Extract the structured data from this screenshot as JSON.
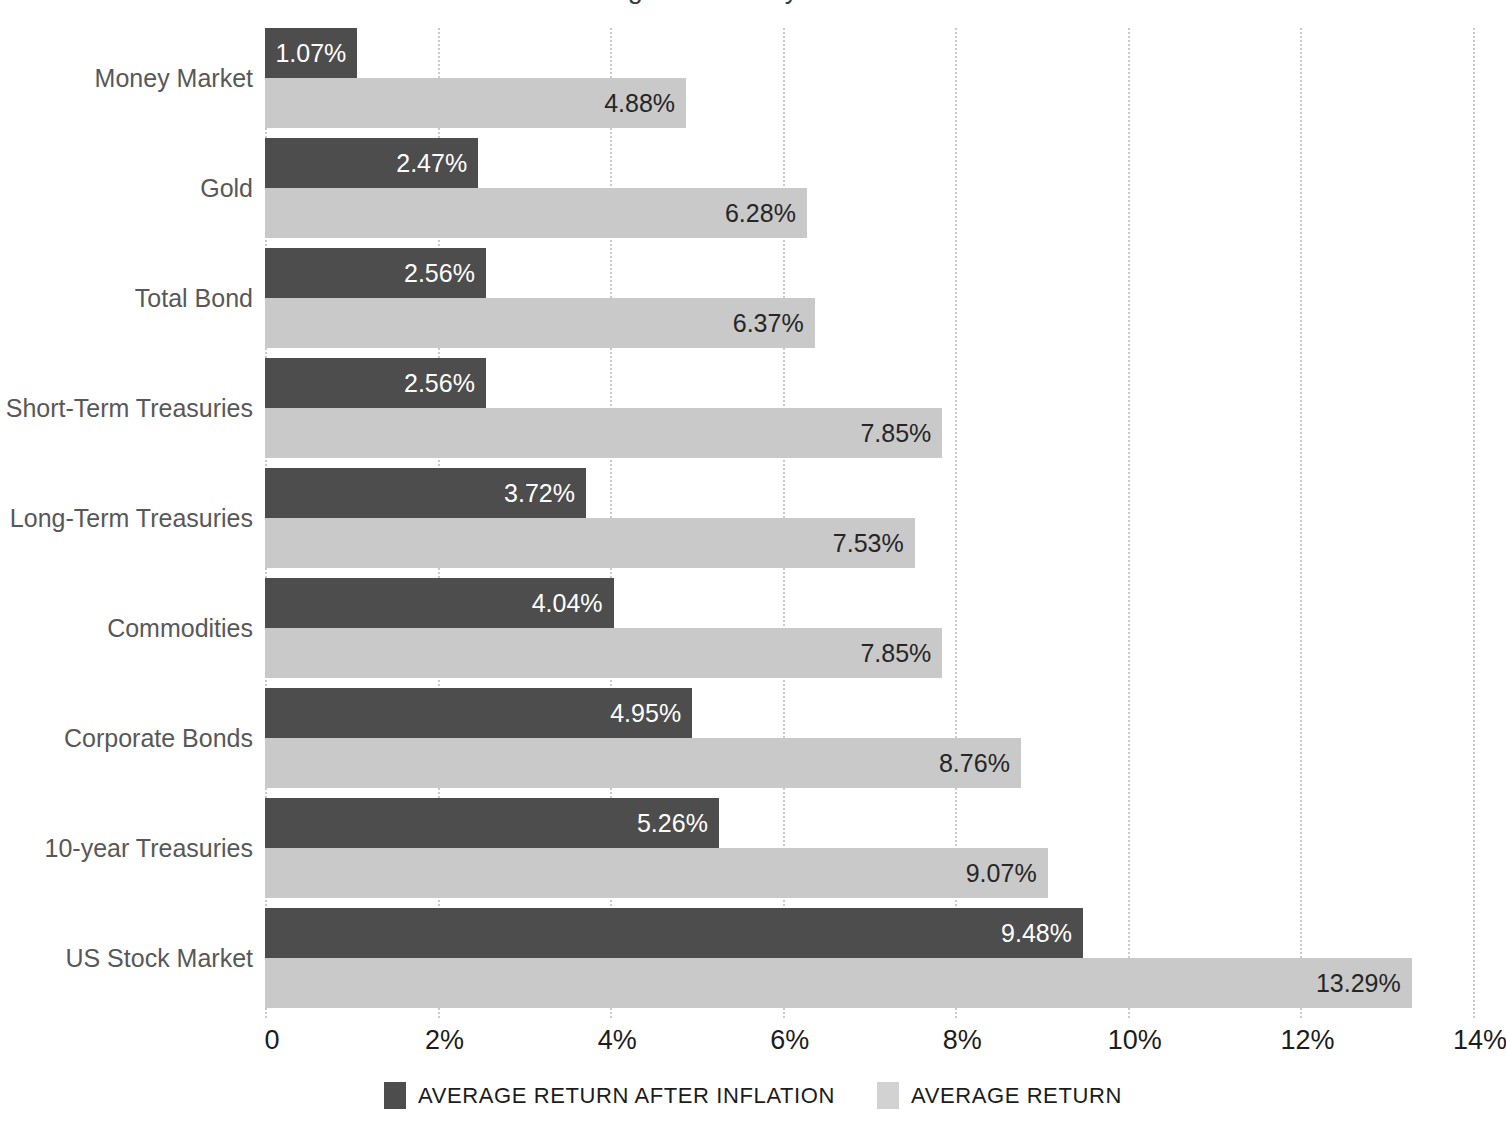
{
  "title_sliver": "Average Returns by Asset Class",
  "chart_data": {
    "type": "bar",
    "orientation": "horizontal",
    "title": "Average Returns by Asset Class",
    "xlabel": "",
    "ylabel": "",
    "xlim": [
      0,
      14
    ],
    "grid": "dotted vertical gridlines at each x tick",
    "legend_position": "bottom-center",
    "categories": [
      "Money Market",
      "Gold",
      "Total Bond",
      "Short-Term Treasuries",
      "Long-Term Treasuries",
      "Commodities",
      "Corporate Bonds",
      "10-year Treasuries",
      "US Stock Market"
    ],
    "series": [
      {
        "name": "AVERAGE RETURN AFTER INFLATION",
        "color": "#4d4d4d",
        "values": [
          1.07,
          2.47,
          2.56,
          2.56,
          3.72,
          4.04,
          4.95,
          5.26,
          9.48
        ],
        "labels": [
          "1.07%",
          "2.47%",
          "2.56%",
          "2.56%",
          "3.72%",
          "4.04%",
          "4.95%",
          "5.26%",
          "9.48%"
        ]
      },
      {
        "name": "AVERAGE RETURN",
        "color": "#c9c9c9",
        "values": [
          4.88,
          6.28,
          6.37,
          7.85,
          7.53,
          7.85,
          8.76,
          9.07,
          13.29
        ],
        "labels": [
          "4.88%",
          "6.28%",
          "6.37%",
          "7.85%",
          "7.53%",
          "7.85%",
          "8.76%",
          "9.07%",
          "13.29%"
        ]
      }
    ],
    "xticks": [
      0,
      2,
      4,
      6,
      8,
      10,
      12,
      14
    ],
    "xtick_labels": [
      "0",
      "2%",
      "4%",
      "6%",
      "8%",
      "10%",
      "12%",
      "14%"
    ]
  },
  "legend": {
    "items": [
      {
        "label": "AVERAGE RETURN AFTER INFLATION",
        "color": "#4d4d4d"
      },
      {
        "label": "AVERAGE RETURN",
        "color": "#d2d2d2"
      }
    ]
  },
  "colors": {
    "background": "#ffffff",
    "bar_dark": "#4d4d4d",
    "bar_light": "#c9c9c9",
    "category_label": "#585858",
    "axis_text": "#1c1c1c",
    "gridline": "#b9b9b9"
  }
}
